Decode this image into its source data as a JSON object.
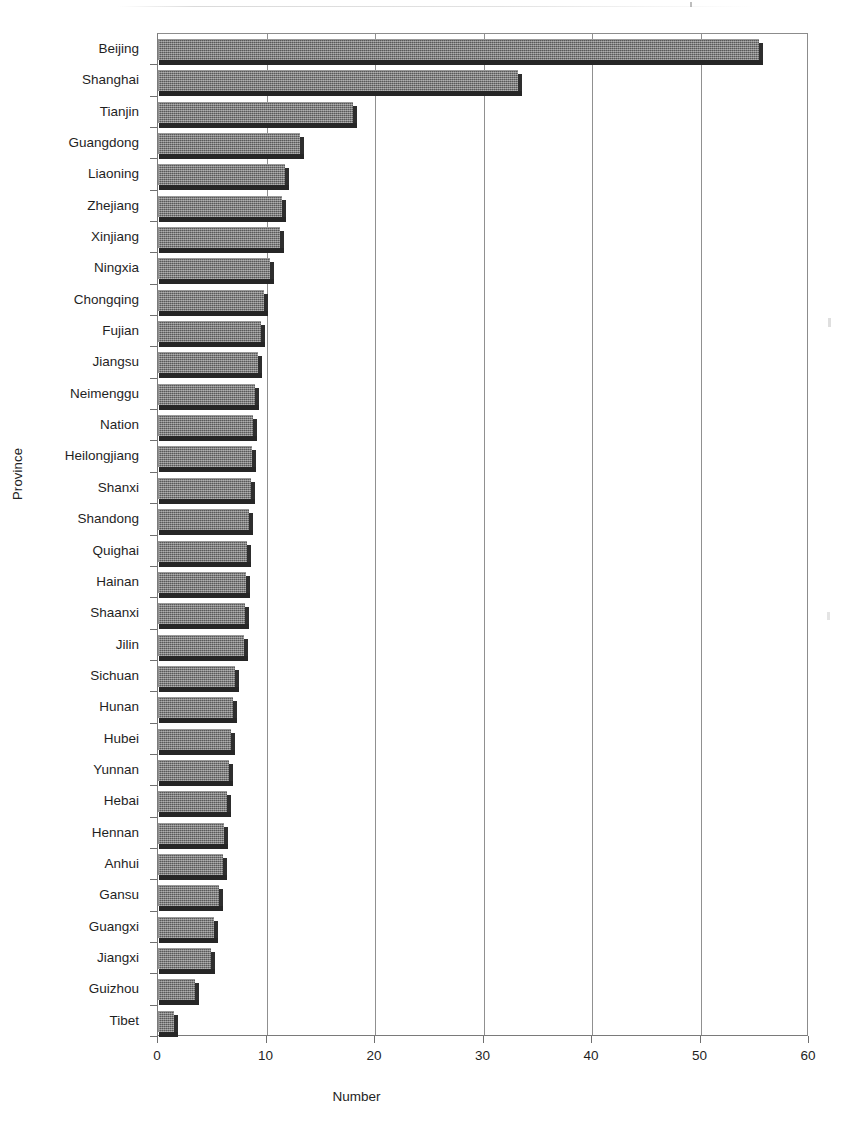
{
  "chart_data": {
    "type": "bar",
    "orientation": "horizontal",
    "title": "",
    "xlabel": "Number",
    "ylabel": "Province",
    "xlim": [
      0,
      60
    ],
    "xticks": [
      0,
      10,
      20,
      30,
      40,
      50,
      60
    ],
    "grid": true,
    "legend": false,
    "categories": [
      "Beijing",
      "Shanghai",
      "Tianjin",
      "Guangdong",
      "Liaoning",
      "Zhejiang",
      "Xinjiang",
      "Ningxia",
      "Chongqing",
      "Fujian",
      "Jiangsu",
      "Neimenggu",
      "Nation",
      "Heilongjiang",
      "Shanxi",
      "Shandong",
      "Quighai",
      "Hainan",
      "Shaanxi",
      "Jilin",
      "Sichuan",
      "Hunan",
      "Hubei",
      "Yunnan",
      "Hebai",
      "Hennan",
      "Anhui",
      "Gansu",
      "Guangxi",
      "Jiangxi",
      "Guizhou",
      "Tibet"
    ],
    "values": [
      55.4,
      33.2,
      18.0,
      13.1,
      11.7,
      11.4,
      11.2,
      10.3,
      9.8,
      9.5,
      9.2,
      8.9,
      8.8,
      8.7,
      8.6,
      8.4,
      8.2,
      8.1,
      8.0,
      7.9,
      7.1,
      6.9,
      6.7,
      6.5,
      6.4,
      6.1,
      6.0,
      5.6,
      5.2,
      4.9,
      3.4,
      1.5
    ],
    "series": [
      {
        "name": "Number",
        "values": [
          55.4,
          33.2,
          18.0,
          13.1,
          11.7,
          11.4,
          11.2,
          10.3,
          9.8,
          9.5,
          9.2,
          8.9,
          8.8,
          8.7,
          8.6,
          8.4,
          8.2,
          8.1,
          8.0,
          7.9,
          7.1,
          6.9,
          6.7,
          6.5,
          6.4,
          6.1,
          6.0,
          5.6,
          5.2,
          4.9,
          3.4,
          1.5
        ]
      }
    ],
    "colors": {
      "bar_fill": "#6b6b6b",
      "bar_edge": "#262626",
      "grid": "#909090",
      "axis": "#7a7a7a",
      "text": "#1f1f1f",
      "background": "#ffffff"
    }
  }
}
